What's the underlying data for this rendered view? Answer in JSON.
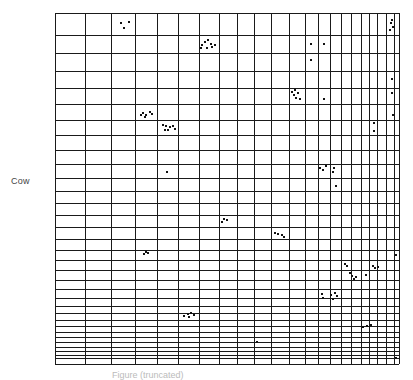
{
  "chart_data": {
    "type": "scatter",
    "title": "",
    "ylabel": "Cow",
    "xlabel": "",
    "caption": "Figure (truncated)",
    "grid": true,
    "plot_area_px": {
      "left": 55,
      "top": 13,
      "right": 399,
      "bottom": 364
    },
    "vertical_gridlines_px": [
      55,
      85,
      111,
      135,
      157,
      178,
      199,
      219,
      237,
      254,
      271,
      289,
      305,
      318,
      330,
      341,
      351,
      361,
      369,
      377,
      386,
      394,
      399
    ],
    "horizontal_gridlines_px": [
      13,
      35,
      53,
      71,
      88,
      104,
      120,
      135,
      150,
      164,
      178,
      191,
      203,
      215,
      227,
      239,
      250,
      260,
      270,
      280,
      289,
      298,
      306,
      313,
      320,
      326,
      332,
      337,
      342,
      347,
      351,
      355,
      358,
      364
    ],
    "points_px": [
      [
        121,
        23
      ],
      [
        124,
        28
      ],
      [
        129,
        22
      ],
      [
        202,
        45
      ],
      [
        205,
        42
      ],
      [
        208,
        40
      ],
      [
        211,
        44
      ],
      [
        207,
        48
      ],
      [
        212,
        47
      ],
      [
        215,
        45
      ],
      [
        201,
        48
      ],
      [
        311,
        44
      ],
      [
        324,
        44
      ],
      [
        311,
        60
      ],
      [
        391,
        23
      ],
      [
        393,
        27
      ],
      [
        390,
        30
      ],
      [
        392,
        20
      ],
      [
        392,
        79
      ],
      [
        392,
        93
      ],
      [
        393,
        115
      ],
      [
        292,
        92
      ],
      [
        294,
        95
      ],
      [
        296,
        98
      ],
      [
        298,
        93
      ],
      [
        300,
        99
      ],
      [
        295,
        90
      ],
      [
        324,
        99
      ],
      [
        141,
        115
      ],
      [
        143,
        113
      ],
      [
        146,
        115
      ],
      [
        150,
        112
      ],
      [
        152,
        114
      ],
      [
        145,
        117
      ],
      [
        163,
        125
      ],
      [
        166,
        126
      ],
      [
        170,
        127
      ],
      [
        173,
        126
      ],
      [
        168,
        130
      ],
      [
        165,
        130
      ],
      [
        175,
        129
      ],
      [
        374,
        123
      ],
      [
        374,
        131
      ],
      [
        167,
        172
      ],
      [
        320,
        168
      ],
      [
        323,
        170
      ],
      [
        326,
        166
      ],
      [
        334,
        168
      ],
      [
        333,
        172
      ],
      [
        336,
        186
      ],
      [
        222,
        222
      ],
      [
        224,
        219
      ],
      [
        227,
        220
      ],
      [
        275,
        233
      ],
      [
        278,
        234
      ],
      [
        282,
        235
      ],
      [
        284,
        237
      ],
      [
        144,
        254
      ],
      [
        146,
        252
      ],
      [
        148,
        253
      ],
      [
        396,
        255
      ],
      [
        345,
        264
      ],
      [
        347,
        266
      ],
      [
        350,
        273
      ],
      [
        352,
        276
      ],
      [
        356,
        277
      ],
      [
        354,
        279
      ],
      [
        366,
        275
      ],
      [
        373,
        266
      ],
      [
        375,
        268
      ],
      [
        378,
        267
      ],
      [
        322,
        294
      ],
      [
        323,
        298
      ],
      [
        331,
        295
      ],
      [
        335,
        293
      ],
      [
        333,
        299
      ],
      [
        337,
        296
      ],
      [
        184,
        316
      ],
      [
        188,
        314
      ],
      [
        191,
        313
      ],
      [
        194,
        315
      ],
      [
        189,
        317
      ],
      [
        363,
        327
      ],
      [
        367,
        326
      ],
      [
        371,
        325
      ],
      [
        257,
        342
      ],
      [
        396,
        358
      ]
    ]
  }
}
